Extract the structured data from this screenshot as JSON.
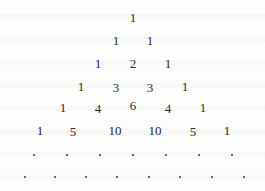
{
  "rows": [
    {
      "values": [
        "1"
      ],
      "y": 18,
      "x": [
        133
      ]
    },
    {
      "values": [
        "1",
        "1"
      ],
      "y": 41,
      "x": [
        116,
        150
      ]
    },
    {
      "values": [
        "1",
        "2",
        "1"
      ],
      "y": 64,
      "x": [
        98,
        133,
        168
      ]
    },
    {
      "values": [
        "1",
        "3",
        "3",
        "1"
      ],
      "y": 87,
      "x": [
        81,
        116,
        150,
        185
      ]
    },
    {
      "values": [
        "1",
        "4",
        "6",
        "4",
        "1"
      ],
      "y": 108,
      "x": [
        63,
        98,
        133,
        168,
        203
      ]
    },
    {
      "values": [
        "1",
        "5",
        "10",
        "10",
        "5",
        "1"
      ],
      "y": 131,
      "x": [
        40,
        73,
        115,
        155,
        193,
        227
      ]
    }
  ],
  "continuation_rows": [
    {
      "marker": ".",
      "count": 7,
      "y": 155,
      "x": [
        34,
        67,
        100,
        133,
        166,
        199,
        232
      ]
    },
    {
      "marker": ".",
      "count": 8,
      "y": 177,
      "x": [
        25,
        55,
        86,
        117,
        149,
        180,
        212,
        244
      ]
    }
  ],
  "colors": {
    "text": "#2b2b2b",
    "background": "#fdfdfc"
  }
}
